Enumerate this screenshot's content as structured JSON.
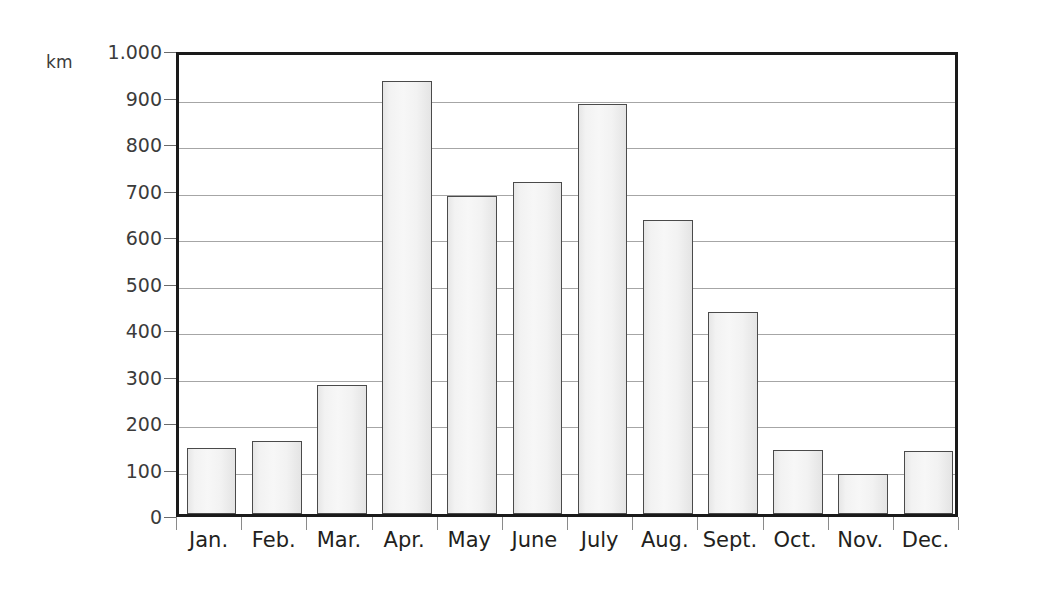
{
  "chart_data": {
    "type": "bar",
    "title": "",
    "xlabel": "",
    "ylabel": "km",
    "categories": [
      "Jan.",
      "Feb.",
      "Mar.",
      "Apr.",
      "May",
      "June",
      "July",
      "Aug.",
      "Sept.",
      "Oct.",
      "Nov.",
      "Dec."
    ],
    "values": [
      141,
      156,
      278,
      932,
      683,
      713,
      882,
      633,
      435,
      138,
      85,
      136
    ],
    "ylim": [
      0,
      1000
    ],
    "ytick_values": [
      0,
      100,
      200,
      300,
      400,
      500,
      600,
      700,
      800,
      900,
      1000
    ],
    "ytick_labels": [
      "0",
      "100",
      "200",
      "300",
      "400",
      "500",
      "600",
      "700",
      "800",
      "900",
      "1.000"
    ],
    "grid": true,
    "gridline_values": [
      100,
      200,
      300,
      400,
      500,
      600,
      700,
      800,
      900
    ],
    "legend": null,
    "legend_position": "none",
    "annotations": []
  },
  "style": {
    "unit_label": "km",
    "bar_fill_light": "#f7f7f7",
    "bar_fill_edge": "#e4e4e4",
    "bar_border": "#4a4a4a",
    "gridline_color": "#a6a6a6",
    "frame_color": "#1a1a1a",
    "tick_color": "#8a8a8a",
    "text_color": "#231f20",
    "background": "#ffffff"
  }
}
